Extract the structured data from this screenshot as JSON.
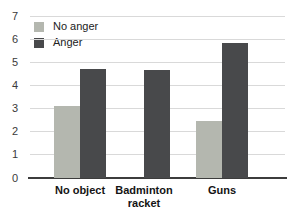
{
  "chart_data": {
    "type": "bar",
    "categories": [
      "No object",
      "Badminton racket",
      "Guns"
    ],
    "series": [
      {
        "name": "No anger",
        "color": "#b4b7af",
        "values": [
          3.1,
          null,
          2.45
        ]
      },
      {
        "name": "Anger",
        "color": "#48494b",
        "values": [
          4.7,
          4.65,
          5.85
        ]
      }
    ],
    "ylim": [
      0,
      7
    ],
    "yticks": [
      0,
      1,
      2,
      3,
      4,
      5,
      6,
      7
    ],
    "grid": true,
    "legend_position": "top-left",
    "colors": {
      "gridline": "#d9d9d9",
      "baseline": "#3c3c3c",
      "background": "#ffffff"
    }
  }
}
